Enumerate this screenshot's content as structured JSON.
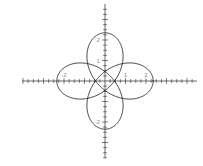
{
  "figure": {
    "name": "parametric-curve-plot",
    "background_color": "#ffffff",
    "curve_color": "#1a1a1a",
    "axis_color": "#2b2b2b",
    "tick_label_color": "#777777",
    "width_px": 203,
    "height_px": 166
  },
  "axes": {
    "x_label": "",
    "y_label": "",
    "origin_px": {
      "x": 105,
      "y": 81
    },
    "unit_px": 20.5,
    "minor_tick_step": 0.25,
    "major_tick_step": 1,
    "xlim": [
      -4.05,
      4.45
    ],
    "ylim": [
      -3.75,
      3.65
    ],
    "grid": false,
    "x_tick_labels": [
      {
        "value": -2,
        "text": "-2"
      },
      {
        "value": 1,
        "text": "1"
      },
      {
        "value": 2,
        "text": "2"
      }
    ],
    "y_tick_labels": [
      {
        "value": 2,
        "text": "2"
      },
      {
        "value": 1,
        "text": "1"
      },
      {
        "value": -2,
        "text": "-2"
      }
    ]
  },
  "chart_data": {
    "type": "line",
    "title": "",
    "subtitle": "",
    "xlabel": "",
    "ylabel": "",
    "xlim": [
      -4.05,
      4.45
    ],
    "ylim": [
      -3.75,
      3.65
    ],
    "grid": false,
    "legend": [],
    "legend_position": "none",
    "annotations": [],
    "parametric": {
      "x_expression": "cos(t) + 1.35*cos(3*t)",
      "y_expression": "sin(t) - 1.35*sin(3*t)",
      "t_range": [
        0,
        6.283185307179586
      ],
      "t_samples": 720
    },
    "x_tick_values": [
      -2,
      1,
      2
    ],
    "y_tick_values": [
      2,
      1,
      -2
    ],
    "features": {
      "loop_count": 4,
      "loop_centers": [
        {
          "x": -1.75,
          "y": 1.75,
          "orientation": "diagonal-up-left"
        },
        {
          "x": 2.05,
          "y": 1.25,
          "orientation": "horizontal-right"
        },
        {
          "x": -2.15,
          "y": -1.2,
          "orientation": "horizontal-left"
        },
        {
          "x": 1.25,
          "y": -2.2,
          "orientation": "vertical-down"
        }
      ],
      "inner_region_extent": {
        "x": [
          -1.3,
          1.3
        ],
        "y": [
          -1.3,
          1.3
        ]
      },
      "crossings_on_y_axis": [
        1.2,
        -1.2
      ],
      "crossings_on_x_axis": [
        -1.2,
        1.2
      ]
    }
  }
}
